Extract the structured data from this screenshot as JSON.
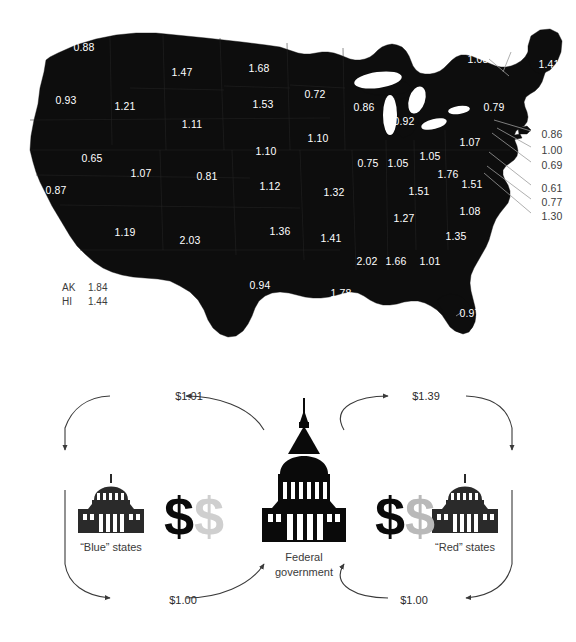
{
  "map": {
    "title_visible": false,
    "fill_color": "#0d0d0d",
    "label_color": "#ffffff",
    "state_labels": [
      {
        "abbr": "WA",
        "value": "0.88",
        "x": 84,
        "y": 47
      },
      {
        "abbr": "OR",
        "value": "0.93",
        "x": 66,
        "y": 100
      },
      {
        "abbr": "MT",
        "value": "1.47",
        "x": 182,
        "y": 72
      },
      {
        "abbr": "ID",
        "value": "1.21",
        "x": 125,
        "y": 106
      },
      {
        "abbr": "ND",
        "value": "1.68",
        "x": 259,
        "y": 68
      },
      {
        "abbr": "SD",
        "value": "1.53",
        "x": 263,
        "y": 104
      },
      {
        "abbr": "MN",
        "value": "0.72",
        "x": 315,
        "y": 94
      },
      {
        "abbr": "WI",
        "value": "0.86",
        "x": 364,
        "y": 107
      },
      {
        "abbr": "MI",
        "value": "0.92",
        "x": 404,
        "y": 121
      },
      {
        "abbr": "WY",
        "value": "1.11",
        "x": 192,
        "y": 124
      },
      {
        "abbr": "NE",
        "value": "1.10",
        "x": 266,
        "y": 151
      },
      {
        "abbr": "IA",
        "value": "1.10",
        "x": 318,
        "y": 138
      },
      {
        "abbr": "NV",
        "value": "0.65",
        "x": 92,
        "y": 158
      },
      {
        "abbr": "UT",
        "value": "1.07",
        "x": 141,
        "y": 173
      },
      {
        "abbr": "CO",
        "value": "0.81",
        "x": 207,
        "y": 176
      },
      {
        "abbr": "CA",
        "value": "0.87",
        "x": 56,
        "y": 190
      },
      {
        "abbr": "KS",
        "value": "1.12",
        "x": 270,
        "y": 186
      },
      {
        "abbr": "MO",
        "value": "1.32",
        "x": 334,
        "y": 192
      },
      {
        "abbr": "IL",
        "value": "0.75",
        "x": 368,
        "y": 163
      },
      {
        "abbr": "IN",
        "value": "1.05",
        "x": 398,
        "y": 163
      },
      {
        "abbr": "OH",
        "value": "1.05",
        "x": 430,
        "y": 156
      },
      {
        "abbr": "PA",
        "value": "1.07",
        "x": 470,
        "y": 142
      },
      {
        "abbr": "WV",
        "value": "1.76",
        "x": 448,
        "y": 174
      },
      {
        "abbr": "KY",
        "value": "1.51",
        "x": 419,
        "y": 191
      },
      {
        "abbr": "VA",
        "value": "1.51",
        "x": 472,
        "y": 184
      },
      {
        "abbr": "NC",
        "value": "1.08",
        "x": 470,
        "y": 211
      },
      {
        "abbr": "TN",
        "value": "1.27",
        "x": 404,
        "y": 218
      },
      {
        "abbr": "AZ",
        "value": "1.19",
        "x": 125,
        "y": 232
      },
      {
        "abbr": "NM",
        "value": "2.03",
        "x": 190,
        "y": 240
      },
      {
        "abbr": "OK",
        "value": "1.36",
        "x": 280,
        "y": 231
      },
      {
        "abbr": "AR",
        "value": "1.41",
        "x": 331,
        "y": 238
      },
      {
        "abbr": "SC",
        "value": "1.35",
        "x": 456,
        "y": 236
      },
      {
        "abbr": "MS",
        "value": "2.02",
        "x": 367,
        "y": 261
      },
      {
        "abbr": "AL",
        "value": "1.66",
        "x": 396,
        "y": 261
      },
      {
        "abbr": "GA",
        "value": "1.01",
        "x": 430,
        "y": 261
      },
      {
        "abbr": "TX",
        "value": "0.94",
        "x": 260,
        "y": 285
      },
      {
        "abbr": "LA",
        "value": "1.78",
        "x": 341,
        "y": 293
      },
      {
        "abbr": "FL",
        "value": "0.97",
        "x": 470,
        "y": 313
      },
      {
        "abbr": "NY",
        "value": "0.79",
        "x": 494,
        "y": 107
      },
      {
        "abbr": "VT",
        "value": "0.71",
        "x": 511,
        "y": 44
      },
      {
        "abbr": "NH",
        "value": "1.08",
        "x": 478,
        "y": 59
      },
      {
        "abbr": "ME",
        "value": "1.41",
        "x": 549,
        "y": 64
      }
    ],
    "leader_labels": [
      {
        "abbr": "MA",
        "value": "0.86",
        "x": 552,
        "y": 134,
        "lx": 494,
        "ly": 120
      },
      {
        "abbr": "RI",
        "value": "1.00",
        "x": 552,
        "y": 150,
        "lx": 497,
        "ly": 128
      },
      {
        "abbr": "CT",
        "value": "0.69",
        "x": 552,
        "y": 165,
        "lx": 492,
        "ly": 133
      },
      {
        "abbr": "NJ",
        "value": "0.61",
        "x": 552,
        "y": 188,
        "lx": 489,
        "ly": 152
      },
      {
        "abbr": "DE",
        "value": "0.77",
        "x": 552,
        "y": 202,
        "lx": 487,
        "ly": 166
      },
      {
        "abbr": "MD",
        "value": "1.30",
        "x": 552,
        "y": 216,
        "lx": 484,
        "ly": 173
      }
    ],
    "offmap_legend": [
      {
        "abbr": "AK",
        "value": "1.84"
      },
      {
        "abbr": "HI",
        "value": "1.44"
      }
    ]
  },
  "diagram": {
    "nodes": {
      "left": {
        "caption": "“Blue” states",
        "icon": "state-capitol-icon"
      },
      "center": {
        "caption_line1": "Federal",
        "caption_line2": "government",
        "icon": "us-capitol-icon"
      },
      "right": {
        "caption": "“Red” states",
        "icon": "state-capitol-icon"
      }
    },
    "flows": {
      "left_top": {
        "amount": "$1.01",
        "direction": "federal-to-blue"
      },
      "left_bottom": {
        "amount": "$1.00",
        "direction": "blue-to-federal"
      },
      "right_top": {
        "amount": "$1.39",
        "direction": "federal-to-red"
      },
      "right_bottom": {
        "amount": "$1.00",
        "direction": "red-to-federal"
      }
    },
    "money": {
      "left_solid": "$",
      "left_ghost": "$",
      "right_solid": "$",
      "right_ghost": "$"
    },
    "colors": {
      "ink": "#0a0a0a",
      "ghost": "#cfcfcf",
      "arrow": "#3a3a3a",
      "text": "#3a3a3a"
    }
  },
  "chart_data": {
    "type": "map",
    "unit": "dollars received per dollar paid",
    "value_range": [
      0.61,
      2.03
    ],
    "states": [
      {
        "abbr": "WA",
        "value": 0.88
      },
      {
        "abbr": "OR",
        "value": 0.93
      },
      {
        "abbr": "MT",
        "value": 1.47
      },
      {
        "abbr": "ID",
        "value": 1.21
      },
      {
        "abbr": "ND",
        "value": 1.68
      },
      {
        "abbr": "SD",
        "value": 1.53
      },
      {
        "abbr": "MN",
        "value": 0.72
      },
      {
        "abbr": "WI",
        "value": 0.86
      },
      {
        "abbr": "MI",
        "value": 0.92
      },
      {
        "abbr": "WY",
        "value": 1.11
      },
      {
        "abbr": "NE",
        "value": 1.1
      },
      {
        "abbr": "IA",
        "value": 1.1
      },
      {
        "abbr": "NV",
        "value": 0.65
      },
      {
        "abbr": "UT",
        "value": 1.07
      },
      {
        "abbr": "CO",
        "value": 0.81
      },
      {
        "abbr": "CA",
        "value": 0.87
      },
      {
        "abbr": "KS",
        "value": 1.12
      },
      {
        "abbr": "MO",
        "value": 1.32
      },
      {
        "abbr": "IL",
        "value": 0.75
      },
      {
        "abbr": "IN",
        "value": 1.05
      },
      {
        "abbr": "OH",
        "value": 1.05
      },
      {
        "abbr": "PA",
        "value": 1.07
      },
      {
        "abbr": "WV",
        "value": 1.76
      },
      {
        "abbr": "KY",
        "value": 1.51
      },
      {
        "abbr": "VA",
        "value": 1.51
      },
      {
        "abbr": "NC",
        "value": 1.08
      },
      {
        "abbr": "TN",
        "value": 1.27
      },
      {
        "abbr": "AZ",
        "value": 1.19
      },
      {
        "abbr": "NM",
        "value": 2.03
      },
      {
        "abbr": "OK",
        "value": 1.36
      },
      {
        "abbr": "AR",
        "value": 1.41
      },
      {
        "abbr": "SC",
        "value": 1.35
      },
      {
        "abbr": "MS",
        "value": 2.02
      },
      {
        "abbr": "AL",
        "value": 1.66
      },
      {
        "abbr": "GA",
        "value": 1.01
      },
      {
        "abbr": "TX",
        "value": 0.94
      },
      {
        "abbr": "LA",
        "value": 1.78
      },
      {
        "abbr": "FL",
        "value": 0.97
      },
      {
        "abbr": "NY",
        "value": 0.79
      },
      {
        "abbr": "VT",
        "value": 0.71
      },
      {
        "abbr": "NH",
        "value": 1.08
      },
      {
        "abbr": "ME",
        "value": 1.41
      },
      {
        "abbr": "MA",
        "value": 0.86
      },
      {
        "abbr": "RI",
        "value": 1.0
      },
      {
        "abbr": "CT",
        "value": 0.69
      },
      {
        "abbr": "NJ",
        "value": 0.61
      },
      {
        "abbr": "DE",
        "value": 0.77
      },
      {
        "abbr": "MD",
        "value": 1.3
      },
      {
        "abbr": "AK",
        "value": 1.84
      },
      {
        "abbr": "HI",
        "value": 1.44
      }
    ],
    "flow_diagram": {
      "type": "flow",
      "nodes": [
        "“Blue” states",
        "Federal government",
        "“Red” states"
      ],
      "edges": [
        {
          "from": "Federal government",
          "to": "“Blue” states",
          "value": 1.01,
          "label": "$1.01"
        },
        {
          "from": "“Blue” states",
          "to": "Federal government",
          "value": 1.0,
          "label": "$1.00"
        },
        {
          "from": "Federal government",
          "to": "“Red” states",
          "value": 1.39,
          "label": "$1.39"
        },
        {
          "from": "“Red” states",
          "to": "Federal government",
          "value": 1.0,
          "label": "$1.00"
        }
      ]
    }
  }
}
